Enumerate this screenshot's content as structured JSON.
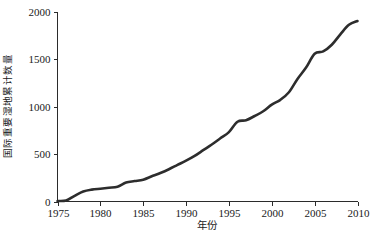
{
  "figure": {
    "background_color": "#ffffff",
    "line_color": "#2d2d2d",
    "axis_color": "#2b2b2b"
  },
  "chart_data": {
    "type": "line",
    "title": "",
    "subtitle": "",
    "xlabel": "年份",
    "ylabel": "国际重要湿地累计数量",
    "xlim": [
      1975,
      2010
    ],
    "ylim": [
      0,
      2000
    ],
    "grid": false,
    "legend": null,
    "legend_position": "none",
    "xticks": [
      1975,
      1980,
      1985,
      1990,
      1995,
      2000,
      2005,
      2010
    ],
    "xtick_labels": [
      "1975",
      "1980",
      "1985",
      "1990",
      "1995",
      "2000",
      "2005",
      "2010"
    ],
    "yticks": [
      0,
      500,
      1000,
      1500,
      2000
    ],
    "ytick_labels": [
      "0",
      "500",
      "1000",
      "1500",
      "2000"
    ],
    "annotations": [],
    "series": [
      {
        "name": "国际重要湿地累计数量",
        "color": "#2d2d2d",
        "x": [
          1975,
          1976,
          1977,
          1978,
          1979,
          1980,
          1981,
          1982,
          1983,
          1984,
          1985,
          1986,
          1987,
          1988,
          1989,
          1990,
          1991,
          1992,
          1993,
          1994,
          1995,
          1996,
          1997,
          1998,
          1999,
          2000,
          2001,
          2002,
          2003,
          2004,
          2005,
          2006,
          2007,
          2008,
          2009,
          2010
        ],
        "values": [
          5,
          10,
          60,
          105,
          125,
          135,
          145,
          155,
          200,
          215,
          230,
          265,
          300,
          340,
          385,
          430,
          480,
          540,
          600,
          665,
          730,
          840,
          855,
          900,
          950,
          1020,
          1070,
          1150,
          1290,
          1410,
          1555,
          1580,
          1650,
          1760,
          1860,
          1900
        ]
      }
    ]
  }
}
